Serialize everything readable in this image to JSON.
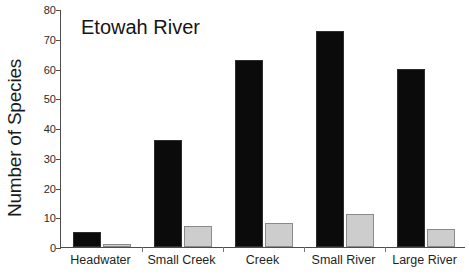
{
  "chart_data": {
    "type": "bar",
    "title": "Etowah River",
    "xlabel": "",
    "ylabel": "Number of Species",
    "categories": [
      "Headwater",
      "Small Creek",
      "Creek",
      "Small River",
      "Large River"
    ],
    "series": [
      {
        "name": "series-1",
        "color": "#0b0b0b",
        "values": [
          5,
          36,
          63,
          72.5,
          60
        ]
      },
      {
        "name": "series-2",
        "color": "#cdcdcd",
        "values": [
          1,
          7,
          8,
          11,
          6
        ]
      }
    ],
    "ylim": [
      0,
      80
    ],
    "yticks": [
      0,
      10,
      20,
      30,
      40,
      50,
      60,
      70,
      80
    ],
    "ytick_labels": [
      "0",
      "10",
      "20",
      "30",
      "40",
      "50",
      "60",
      "70",
      "80"
    ],
    "grid": false,
    "legend": "none"
  }
}
